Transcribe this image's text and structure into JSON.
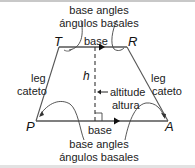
{
  "diagram": {
    "type": "trapezoid",
    "vertices": {
      "top_left": "T",
      "top_right": "R",
      "bottom_left": "P",
      "bottom_right": "A"
    },
    "top_angles_label": {
      "en": "base angles",
      "es": "ángulos basales"
    },
    "bottom_angles_label": {
      "en": "base angles",
      "es": "ángulos basales"
    },
    "top_base_label": "base",
    "bottom_base_label": "base",
    "left_leg_label": {
      "en": "leg",
      "es": "cateto"
    },
    "right_leg_label": {
      "en": "leg",
      "es": "cateto"
    },
    "height_label": "h",
    "altitude_label": {
      "en": "altitude",
      "es": "altura"
    },
    "colors": {
      "stroke": "#333333",
      "text": "#222222",
      "border": "#c8c8c8"
    }
  }
}
